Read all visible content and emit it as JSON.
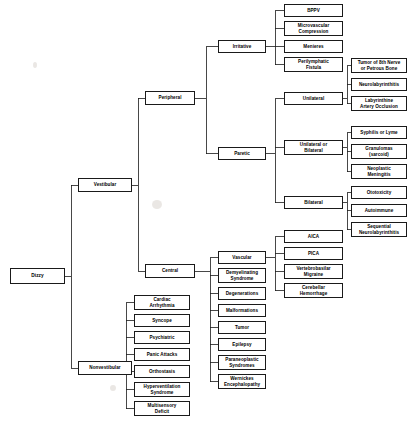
{
  "diagram": {
    "type": "tree",
    "orientation": "left-to-right",
    "stroke_color": "#1a1a1a",
    "box_fill": "#ffffff",
    "text_color": "#000000"
  },
  "nodes": {
    "root": {
      "label": "Dizzy",
      "x": 10,
      "y": 268,
      "w": 55,
      "h": 16
    },
    "vestibular": {
      "label": "Vestibular",
      "x": 78,
      "y": 178,
      "w": 54,
      "h": 14
    },
    "nonvestibular": {
      "label": "Nonvestibular",
      "x": 78,
      "y": 361,
      "w": 54,
      "h": 14
    },
    "peripheral": {
      "label": "Peripheral",
      "x": 145,
      "y": 91,
      "w": 50,
      "h": 14
    },
    "central": {
      "label": "Central",
      "x": 145,
      "y": 264,
      "w": 50,
      "h": 14
    },
    "irritative": {
      "label": "Irritative",
      "x": 218,
      "y": 40,
      "w": 48,
      "h": 13
    },
    "paretic": {
      "label": "Paretic",
      "x": 218,
      "y": 147,
      "w": 48,
      "h": 13
    },
    "bppv": {
      "label": "BPPV",
      "x": 284,
      "y": 4,
      "w": 59,
      "h": 13
    },
    "microvascular_compression": {
      "label": "Microvascular\nCompression",
      "x": 284,
      "y": 21,
      "w": 59,
      "h": 15
    },
    "menieres": {
      "label": "Menieres",
      "x": 284,
      "y": 40,
      "w": 59,
      "h": 13
    },
    "perilymphatic_fistula": {
      "label": "Perilymphatic\nFistula",
      "x": 284,
      "y": 57,
      "w": 59,
      "h": 15
    },
    "unilateral": {
      "label": "Unilateral",
      "x": 284,
      "y": 92,
      "w": 59,
      "h": 13
    },
    "unilateral_or_bilateral": {
      "label": "Unilateral or\nBilateral",
      "x": 284,
      "y": 140,
      "w": 59,
      "h": 15
    },
    "bilateral": {
      "label": "Bilateral",
      "x": 284,
      "y": 196,
      "w": 59,
      "h": 13
    },
    "tumor_8th_nerve": {
      "label": "Tumor of 8th Nerve\nor Petrous Bone",
      "x": 351,
      "y": 58,
      "w": 56,
      "h": 15
    },
    "neurolabyrinthitis": {
      "label": "Neurolabyrinthitis",
      "x": 351,
      "y": 78,
      "w": 56,
      "h": 13
    },
    "labyrinthine_artery_occlusion": {
      "label": "Labyrinthine\nArtery Occlusion",
      "x": 351,
      "y": 96,
      "w": 56,
      "h": 15
    },
    "syphilis_or_lyme": {
      "label": "Syphilis or Lyme",
      "x": 351,
      "y": 126,
      "w": 56,
      "h": 13
    },
    "granulomas_sarcoid": {
      "label": "Granulomas\n(sarcoid)",
      "x": 351,
      "y": 144,
      "w": 56,
      "h": 15
    },
    "neoplastic_meningitis": {
      "label": "Neoplastic\nMeningitis",
      "x": 351,
      "y": 164,
      "w": 56,
      "h": 15
    },
    "ototoxicity": {
      "label": "Ototoxicity",
      "x": 351,
      "y": 186,
      "w": 56,
      "h": 13
    },
    "autoimmune": {
      "label": "Autoimmune",
      "x": 351,
      "y": 204,
      "w": 56,
      "h": 13
    },
    "sequential_neurolabyrinthitis": {
      "label": "Sequential\nNeurolabyrinthitis",
      "x": 351,
      "y": 222,
      "w": 56,
      "h": 15
    },
    "vascular": {
      "label": "Vascular",
      "x": 218,
      "y": 251,
      "w": 48,
      "h": 13
    },
    "demyelinating_syndrome": {
      "label": "Demyelinating\nSyndrome",
      "x": 218,
      "y": 268,
      "w": 48,
      "h": 15
    },
    "degenerations": {
      "label": "Degenerations",
      "x": 218,
      "y": 287,
      "w": 48,
      "h": 13
    },
    "malformations": {
      "label": "Malformations",
      "x": 218,
      "y": 304,
      "w": 48,
      "h": 13
    },
    "tumor": {
      "label": "Tumor",
      "x": 218,
      "y": 321,
      "w": 48,
      "h": 13
    },
    "epilepsy": {
      "label": "Epilepsy",
      "x": 218,
      "y": 338,
      "w": 48,
      "h": 13
    },
    "paraneoplastic_syndromes": {
      "label": "Paraneoplastic\nSyndromes",
      "x": 218,
      "y": 355,
      "w": 48,
      "h": 15
    },
    "wernickes_encephalopathy": {
      "label": "Wernickes\nEncephalopathy",
      "x": 218,
      "y": 374,
      "w": 48,
      "h": 15
    },
    "aica": {
      "label": "AICA",
      "x": 284,
      "y": 230,
      "w": 59,
      "h": 13
    },
    "pica": {
      "label": "PICA",
      "x": 284,
      "y": 247,
      "w": 59,
      "h": 13
    },
    "vertebrobasilar_migraine": {
      "label": "Vertebrobasilar\nMigraine",
      "x": 284,
      "y": 264,
      "w": 59,
      "h": 15
    },
    "cerebellar_hemorrhage": {
      "label": "Cerebellar\nHemorrhage",
      "x": 284,
      "y": 283,
      "w": 59,
      "h": 15
    },
    "cardiac_arrhythmia": {
      "label": "Cardiac\nArrhythmia",
      "x": 134,
      "y": 295,
      "w": 56,
      "h": 15
    },
    "syncope": {
      "label": "Syncope",
      "x": 134,
      "y": 314,
      "w": 56,
      "h": 13
    },
    "psychiatric": {
      "label": "Psychiatric",
      "x": 134,
      "y": 331,
      "w": 56,
      "h": 13
    },
    "panic_attacks": {
      "label": "Panic Attacks",
      "x": 134,
      "y": 348,
      "w": 56,
      "h": 13
    },
    "orthostasis": {
      "label": "Orthostasis",
      "x": 134,
      "y": 365,
      "w": 56,
      "h": 13
    },
    "hyperventilation_syndrome": {
      "label": "Hyperventilation\nSyndrome",
      "x": 134,
      "y": 382,
      "w": 56,
      "h": 15
    },
    "multisensory_deficit": {
      "label": "Multisensory\nDeficit",
      "x": 134,
      "y": 401,
      "w": 56,
      "h": 15
    }
  },
  "edges": [
    {
      "from": "root",
      "to": [
        "vestibular",
        "nonvestibular"
      ],
      "elbow_x": 71
    },
    {
      "from": "vestibular",
      "to": [
        "peripheral",
        "central"
      ],
      "elbow_x": 138
    },
    {
      "from": "peripheral",
      "to": [
        "irritative",
        "paretic"
      ],
      "elbow_x": 206
    },
    {
      "from": "irritative",
      "to": [
        "bppv",
        "microvascular_compression",
        "menieres",
        "perilymphatic_fistula"
      ],
      "elbow_x": 275
    },
    {
      "from": "paretic",
      "to": [
        "unilateral",
        "unilateral_or_bilateral",
        "bilateral"
      ],
      "elbow_x": 275
    },
    {
      "from": "unilateral",
      "to": [
        "tumor_8th_nerve",
        "neurolabyrinthitis",
        "labyrinthine_artery_occlusion"
      ],
      "elbow_x": 347
    },
    {
      "from": "unilateral_or_bilateral",
      "to": [
        "syphilis_or_lyme",
        "granulomas_sarcoid",
        "neoplastic_meningitis"
      ],
      "elbow_x": 347
    },
    {
      "from": "bilateral",
      "to": [
        "ototoxicity",
        "autoimmune",
        "sequential_neurolabyrinthitis"
      ],
      "elbow_x": 347
    },
    {
      "from": "central",
      "to": [
        "vascular",
        "demyelinating_syndrome",
        "degenerations",
        "malformations",
        "tumor",
        "epilepsy",
        "paraneoplastic_syndromes",
        "wernickes_encephalopathy"
      ],
      "elbow_x": 210
    },
    {
      "from": "vascular",
      "to": [
        "aica",
        "pica",
        "vertebrobasilar_migraine",
        "cerebellar_hemorrhage"
      ],
      "elbow_x": 275
    },
    {
      "from": "nonvestibular",
      "to": [
        "cardiac_arrhythmia",
        "syncope",
        "psychiatric",
        "panic_attacks",
        "orthostasis",
        "hyperventilation_syndrome",
        "multisensory_deficit"
      ],
      "elbow_x": 126
    }
  ],
  "artifacts": [
    {
      "name": "scan-smudge-upper",
      "x": 33,
      "y": 62,
      "w": 4,
      "h": 6
    },
    {
      "name": "scan-smudge-middle",
      "x": 152,
      "y": 200,
      "w": 10,
      "h": 9
    },
    {
      "name": "scan-smudge-lower",
      "x": 110,
      "y": 385,
      "w": 6,
      "h": 6
    }
  ]
}
